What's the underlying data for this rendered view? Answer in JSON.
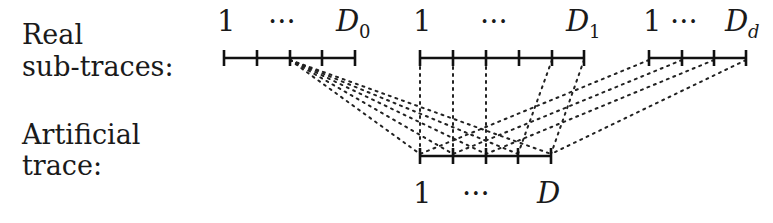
{
  "labels": {
    "real_line1": "Real",
    "real_line2": "sub-traces:",
    "artificial_line1": "Artificial",
    "artificial_line2": "trace:"
  },
  "tracks": {
    "real_0": {
      "start": "1",
      "ellipsis": "···",
      "end_main": "D",
      "end_sub": "0"
    },
    "real_1": {
      "start": "1",
      "ellipsis": "···",
      "end_main": "D",
      "end_sub": "1"
    },
    "real_d": {
      "start": "1",
      "ellipsis": "···",
      "end_main": "D",
      "end_sub": "d"
    },
    "artificial": {
      "start": "1",
      "ellipsis": "···",
      "end_main": "D"
    }
  },
  "geometry": {
    "real_y": 58,
    "artificial_y": 156,
    "real_0_ticks": [
      224,
      257,
      290,
      322,
      355
    ],
    "real_1_ticks": [
      420,
      453,
      486,
      519,
      552,
      584
    ],
    "real_d_ticks": [
      649,
      682,
      714,
      746
    ],
    "artificial_ticks": [
      420,
      453,
      486,
      518,
      551
    ]
  },
  "connections": [
    {
      "from_track": "real_0",
      "from_x": 290,
      "to_x": 420
    },
    {
      "from_track": "real_0",
      "from_x": 290,
      "to_x": 453
    },
    {
      "from_track": "real_0",
      "from_x": 290,
      "to_x": 486
    },
    {
      "from_track": "real_0",
      "from_x": 290,
      "to_x": 518
    },
    {
      "from_track": "real_0",
      "from_x": 290,
      "to_x": 551
    },
    {
      "from_track": "real_1",
      "from_x": 420,
      "to_x": 420
    },
    {
      "from_track": "real_1",
      "from_x": 453,
      "to_x": 453
    },
    {
      "from_track": "real_1",
      "from_x": 486,
      "to_x": 486
    },
    {
      "from_track": "real_1",
      "from_x": 552,
      "to_x": 518
    },
    {
      "from_track": "real_1",
      "from_x": 584,
      "to_x": 551
    },
    {
      "from_track": "real_d",
      "from_x": 649,
      "to_x": 420
    },
    {
      "from_track": "real_d",
      "from_x": 682,
      "to_x": 453
    },
    {
      "from_track": "real_d",
      "from_x": 714,
      "to_x": 486
    },
    {
      "from_track": "real_d",
      "from_x": 746,
      "to_x": 551
    }
  ],
  "colors": {
    "ink": "#111111",
    "background": "#ffffff"
  }
}
